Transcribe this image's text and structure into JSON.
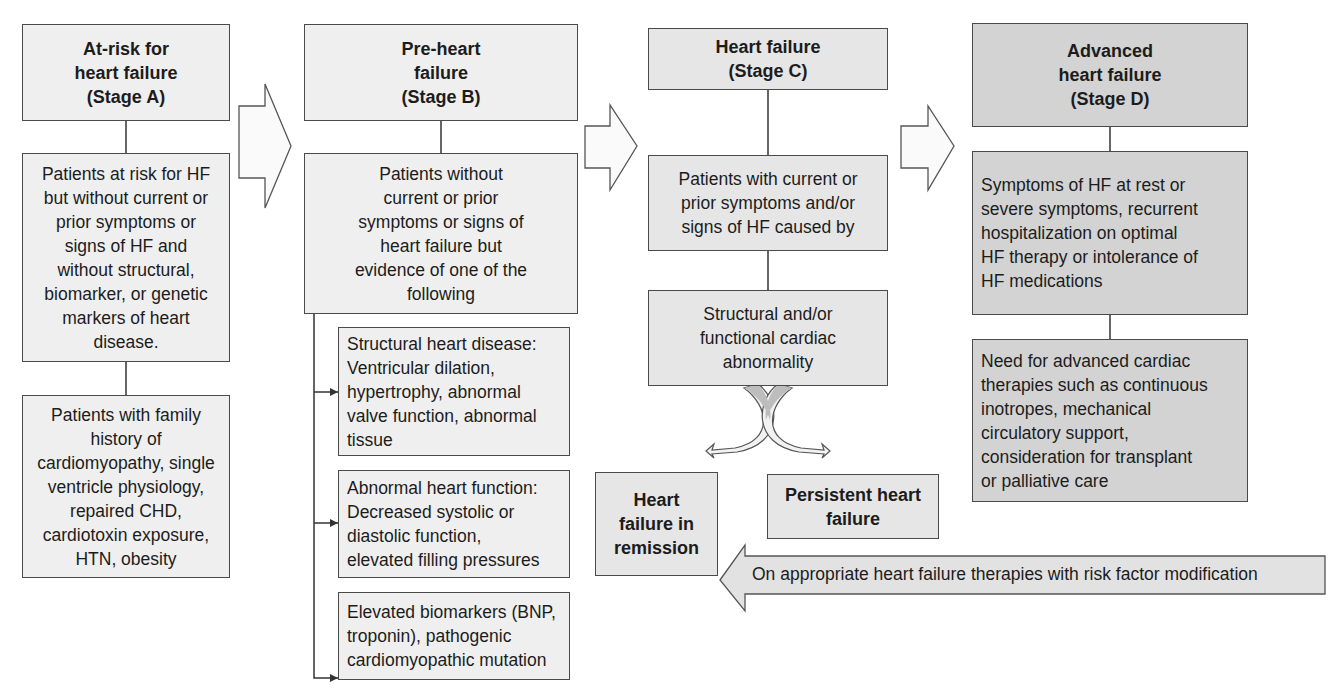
{
  "stages": [
    {
      "id": "A",
      "title": "At-risk for\nheart failure\n(Stage A)",
      "boxes": [
        "Patients at risk for HF\nbut without current or\nprior symptoms or\nsigns of HF and\nwithout structural,\nbiomarker, or genetic\nmarkers of heart\ndisease.",
        "Patients with family\nhistory of\ncardiomyopathy, single\nventricle physiology,\nrepaired CHD,\ncardiotoxin exposure,\nHTN, obesity"
      ]
    },
    {
      "id": "B",
      "title": "Pre-heart\nfailure\n(Stage B)",
      "boxes": [
        "Patients without\ncurrent or prior\nsymptoms or signs of\nheart failure but\nevidence of one of the\nfollowing"
      ],
      "criteria": [
        "Structural heart disease:\nVentricular dilation,\nhypertrophy, abnormal\nvalve function, abnormal\ntissue",
        "Abnormal heart function:\nDecreased systolic or\ndiastolic function,\nelevated filling pressures",
        "Elevated biomarkers (BNP,\ntroponin), pathogenic\ncardiomyopathic mutation"
      ]
    },
    {
      "id": "C",
      "title": "Heart failure\n(Stage C)",
      "boxes": [
        "Patients with current or\nprior symptoms and/or\nsigns of HF caused by",
        "Structural and/or\nfunctional cardiac\nabnormality"
      ]
    },
    {
      "id": "D",
      "title": "Advanced\nheart failure\n(Stage D)",
      "boxes": [
        "Symptoms of HF at rest or\nsevere symptoms, recurrent\nhospitalization on optimal\nHF therapy or intolerance of\nHF medications",
        "Need for advanced cardiac\ntherapies such as continuous\ninotropes, mechanical\ncirculatory support,\nconsideration for transplant\nor palliative care"
      ]
    }
  ],
  "outcomes": {
    "remission": "Heart\nfailure in\nremission",
    "persistent": "Persistent heart\nfailure"
  },
  "therapy_arrow_label": "On appropriate heart failure therapies with risk factor modification"
}
